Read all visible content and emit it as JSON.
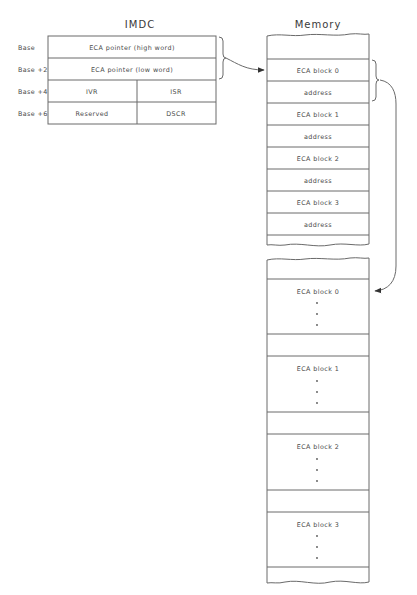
{
  "imdc": {
    "title": "IMDC",
    "rows": [
      {
        "offset": "Base",
        "cells": [
          "ECA pointer (high word)"
        ]
      },
      {
        "offset": "Base +2",
        "cells": [
          "ECA pointer (low word)"
        ]
      },
      {
        "offset": "Base +4",
        "cells": [
          "IVR",
          "ISR"
        ]
      },
      {
        "offset": "Base +6",
        "cells": [
          "Reserved",
          "DSCR"
        ]
      }
    ]
  },
  "memory": {
    "title": "Memory",
    "pointer_table": [
      "ECA block 0",
      "address",
      "ECA block 1",
      "address",
      "ECA block 2",
      "address",
      "ECA block 3",
      "address"
    ],
    "blocks": [
      "ECA block 0",
      "ECA block 1",
      "ECA block 2",
      "ECA block 3"
    ]
  },
  "colors": {
    "line": "#6a6a6a",
    "text": "#4a4a4a",
    "background": "#ffffff"
  }
}
